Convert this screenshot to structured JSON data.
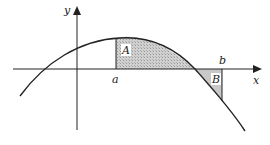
{
  "diagram": {
    "title": "",
    "axes": {
      "x_label": "x",
      "y_label": "y"
    },
    "points": {
      "a": "a",
      "b": "b"
    },
    "regions": {
      "A": "A",
      "B": "B"
    },
    "colors": {
      "curve": "#222222",
      "shade": "#c8c8c8",
      "axis": "#222222"
    }
  }
}
